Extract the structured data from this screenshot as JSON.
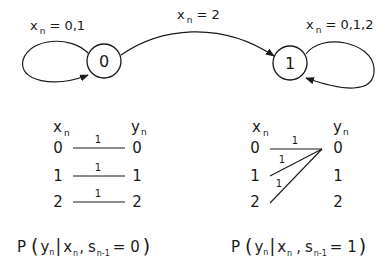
{
  "states": [
    {
      "id": "0",
      "label": "0"
    },
    {
      "id": "1",
      "label": "1"
    }
  ],
  "transitions": {
    "self_loop_0": {
      "var": "x",
      "sub": "n",
      "eq": "= 0,1"
    },
    "zero_to_one": {
      "var": "x",
      "sub": "n",
      "eq": "= 2"
    },
    "self_loop_1": {
      "var": "x",
      "sub": "n",
      "eq": "= 0,1,2"
    }
  },
  "channel_left": {
    "header_x": {
      "var": "x",
      "sub": "n"
    },
    "header_y": {
      "var": "y",
      "sub": "n"
    },
    "inputs": [
      "0",
      "1",
      "2"
    ],
    "outputs": [
      "0",
      "1",
      "2"
    ],
    "edge_probs": [
      "1",
      "1",
      "1"
    ],
    "caption": {
      "p": "P",
      "open": "(",
      "y": "y",
      "y_sub": "n",
      "bar": "|",
      "x": "x",
      "x_sub": "n",
      "comma": ",",
      "s": "s",
      "s_sub": "n-1",
      "eq": "= 0",
      "close": ")"
    }
  },
  "channel_right": {
    "header_x": {
      "var": "x",
      "sub": "n"
    },
    "header_y": {
      "var": "y",
      "sub": "n"
    },
    "inputs": [
      "0",
      "1",
      "2"
    ],
    "outputs": [
      "0",
      "1",
      "2"
    ],
    "edge_probs": [
      "1",
      "1",
      "1"
    ],
    "caption": {
      "p": "P",
      "open": "(",
      "y": "y",
      "y_sub": "n",
      "bar": "|",
      "x": "x",
      "x_sub": "n",
      "comma": ",",
      "s": "s",
      "s_sub": "n-1",
      "eq": "= 1",
      "close": ")"
    }
  }
}
